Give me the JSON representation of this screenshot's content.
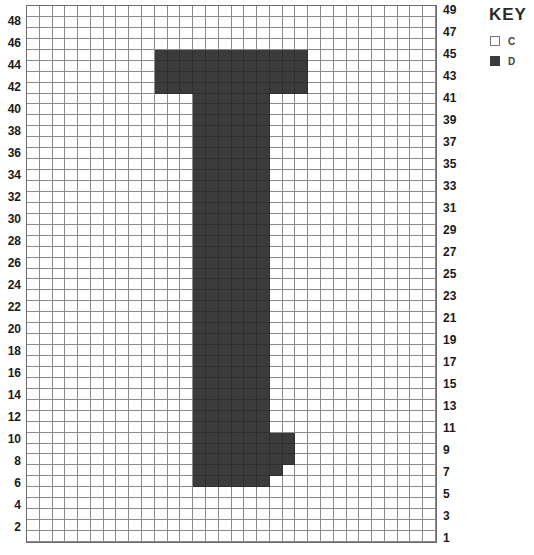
{
  "chart_data": {
    "type": "heatmap",
    "title": "",
    "columns": 32,
    "rows": 49,
    "row_numbering": "bottom-to-top, row 1 at bottom",
    "left_labels": [
      2,
      4,
      6,
      8,
      10,
      12,
      14,
      16,
      18,
      20,
      22,
      24,
      26,
      28,
      30,
      32,
      34,
      36,
      38,
      40,
      42,
      44,
      46,
      48
    ],
    "right_labels": [
      1,
      3,
      5,
      7,
      9,
      11,
      13,
      15,
      17,
      19,
      21,
      23,
      25,
      27,
      29,
      31,
      33,
      35,
      37,
      39,
      41,
      43,
      45,
      47,
      49
    ],
    "filled_color_key": "D",
    "background_color_key": "C",
    "filled_regions": [
      {
        "rows": [
          42,
          45
        ],
        "cols": [
          10,
          21
        ],
        "note": "top bar"
      },
      {
        "rows": [
          6,
          41
        ],
        "cols": [
          13,
          18
        ],
        "note": "stem"
      },
      {
        "rows": [
          8,
          10
        ],
        "cols": [
          13,
          20
        ],
        "note": "foot"
      },
      {
        "rows": [
          7,
          7
        ],
        "cols": [
          13,
          19
        ],
        "note": "foot taper"
      }
    ],
    "grid": true,
    "legend_position": "top-right"
  },
  "key": {
    "title": "KEY",
    "items": [
      {
        "label": "C",
        "color": "#ffffff"
      },
      {
        "label": "D",
        "color": "#3b3b3b"
      }
    ]
  },
  "colors": {
    "filled": "#3b3b3b",
    "empty": "#ffffff",
    "gridline": "#8a8a8a"
  }
}
